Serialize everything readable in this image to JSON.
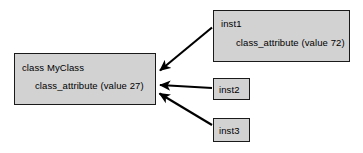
{
  "diagram": {
    "type": "object-relationship-diagram",
    "background_color": "#ffffff",
    "box_fill_color": "#d2d2d2",
    "box_border_color": "#1a1a1a",
    "arrow_color": "#000000",
    "nodes": {
      "myclass": {
        "title": "class MyClass",
        "attribute": "class_attribute (value 27)"
      },
      "inst1": {
        "title": "inst1",
        "attribute": "class_attribute (value 72)"
      },
      "inst2": {
        "title": "inst2"
      },
      "inst3": {
        "title": "inst3"
      }
    },
    "edges": [
      {
        "from": "inst1",
        "to": "myclass"
      },
      {
        "from": "inst2",
        "to": "myclass"
      },
      {
        "from": "inst3",
        "to": "myclass"
      }
    ]
  }
}
